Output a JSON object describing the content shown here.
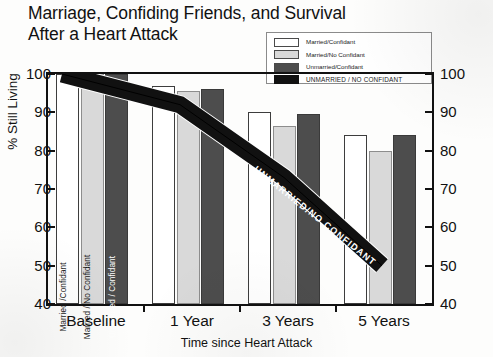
{
  "chart_data": {
    "type": "bar",
    "title": "Marriage, Confiding Friends, and Survival\nAfter a Heart Attack",
    "xlabel": "Time since Heart Attack",
    "ylabel": "% Still Living",
    "categories": [
      "Baseline",
      "1 Year",
      "3 Years",
      "5 Years"
    ],
    "ylim": [
      40,
      100
    ],
    "yticks": [
      40,
      50,
      60,
      70,
      80,
      90,
      100
    ],
    "ytick_labels_left": [
      "100",
      "90",
      "80",
      "70",
      "60",
      "50",
      "40"
    ],
    "ytick_labels_right": [
      "100",
      "90",
      "80",
      "70",
      "60",
      "50",
      "40"
    ],
    "grid": false,
    "legend_position": "top-right",
    "series": [
      {
        "name": "Married/Confidant",
        "color": "#ffffff",
        "values": [
          100,
          97,
          90,
          84
        ]
      },
      {
        "name": "Married/No Confidant",
        "color": "#d9d9d9",
        "values": [
          100,
          95.5,
          86.5,
          80
        ]
      },
      {
        "name": "Unmarried/Confidant",
        "color": "#4d4d4d",
        "values": [
          100,
          96,
          89.5,
          84
        ]
      },
      {
        "name": "UNMARRIED / NO CONFIDANT",
        "color": "#111111",
        "values": [
          100,
          92,
          73,
          50
        ],
        "render": "thick-band"
      }
    ],
    "bar_inline_labels": [
      "Married /Confidant",
      "Married / No Confidant",
      "Unmarried / Confidant"
    ],
    "band_annotation": "UNMARRIED/NO CONFIDANT"
  },
  "title": {
    "line1": "Marriage, Confiding Friends, and Survival",
    "line2": "After a Heart Attack",
    "full": "Marriage, Confiding Friends, and Survival\nAfter a Heart Attack"
  },
  "legend": {
    "items": [
      {
        "label": "Married/Confidant",
        "color": "#ffffff",
        "style": "normal"
      },
      {
        "label": "Married/No Confidant",
        "color": "#d9d9d9",
        "style": "normal"
      },
      {
        "label": "Unmarried/Confidant",
        "color": "#4d4d4d",
        "style": "normal"
      },
      {
        "label": "UNMARRIED / NO CONFIDANT",
        "color": "#111111",
        "style": "caps"
      }
    ]
  },
  "axes": {
    "y_title": "% Still Living",
    "x_title": "Time since Heart Attack",
    "y_ticks": [
      "100",
      "90",
      "80",
      "70",
      "60",
      "50",
      "40"
    ],
    "x_ticks": [
      "Baseline",
      "1 Year",
      "3 Years",
      "5 Years"
    ]
  },
  "annotations": {
    "band_label": "UNMARRIED/NO CONFIDANT",
    "baseline_bar_labels": [
      "Married /Confidant",
      "Married / No Confidant",
      "Unmarried / Confidant"
    ]
  },
  "colors": {
    "white_bar": "#ffffff",
    "gray_bar": "#d9d9d9",
    "dark_bar": "#4d4d4d",
    "band": "#111111",
    "axis": "#111111",
    "background": "#fdfdfc"
  }
}
